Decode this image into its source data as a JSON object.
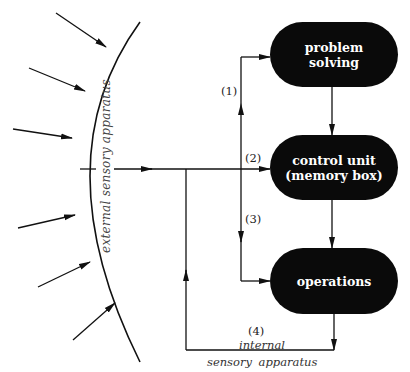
{
  "diagram": {
    "nodes": {
      "problem_solving": {
        "line1": "problem",
        "line2": "solving"
      },
      "control_unit": {
        "line1": "control unit",
        "line2": "(memory box)"
      },
      "operations": {
        "label": "operations"
      }
    },
    "path_labels": {
      "p1": "(1)",
      "p2": "(2)",
      "p3": "(3)",
      "p4": "(4)"
    },
    "external_label": "external sensory apparatus",
    "internal_label_line1": "internal",
    "internal_label_line2": "sensory   apparatus",
    "colors": {
      "node_fill": "#0a0a0a",
      "node_text": "#ffffff",
      "line": "#111111"
    }
  }
}
